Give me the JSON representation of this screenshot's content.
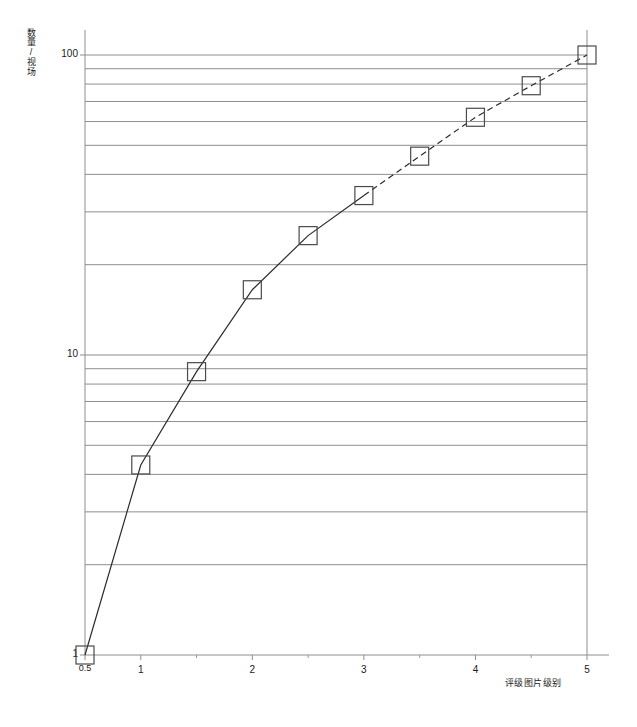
{
  "chart_data": {
    "type": "line",
    "title": "",
    "subtitle": "",
    "xlabel": "评级图片级别",
    "ylabel": "数量/视场",
    "yscale": "log",
    "xscale": "linear",
    "xlim": [
      0.5,
      5
    ],
    "ylim": [
      1,
      100
    ],
    "grid": "horizontal-log-minor",
    "legend": "none",
    "annotations": [],
    "x_ticks_major": [
      0.5,
      1,
      2,
      3,
      4,
      5
    ],
    "x_tick_labels": [
      "0.5",
      "1",
      "2",
      "3",
      "4",
      "5"
    ],
    "x_ticks_minor": [
      1.5,
      2.5,
      3.5,
      4.5
    ],
    "y_ticks_major": [
      1,
      10,
      100
    ],
    "y_tick_labels": [
      "1",
      "10",
      "100"
    ],
    "y_gridlines": [
      2,
      3,
      4,
      5,
      6,
      7,
      8,
      9,
      10,
      20,
      30,
      40,
      50,
      60,
      70,
      80,
      90,
      100
    ],
    "series": [
      {
        "name": "数量/视场",
        "marker": "open-square",
        "line_solid_through_x": 3,
        "line_dashed_from_x": 3,
        "x": [
          0.5,
          1,
          1.5,
          2,
          2.5,
          3,
          3.5,
          4,
          4.5,
          5
        ],
        "values": [
          1.0,
          4.3,
          8.8,
          16.5,
          25.0,
          34.0,
          46.0,
          62.0,
          79.0,
          100.0
        ]
      }
    ]
  }
}
